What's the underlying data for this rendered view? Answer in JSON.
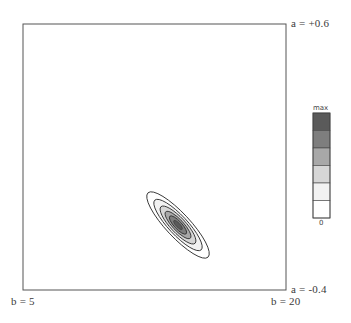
{
  "chart_data": {
    "type": "contour",
    "title": "",
    "x_axis": {
      "label_min": "b = 5",
      "label_max": "b = 20",
      "min": 5,
      "max": 20
    },
    "y_axis": {
      "label_min": "a = -0.4",
      "label_max": "a = +0.6",
      "min": -0.4,
      "max": 0.6
    },
    "grid": false,
    "peak": {
      "b": 13.5,
      "a": -0.15
    },
    "orientation_deg": 45,
    "contour_levels": [
      {
        "level": 1,
        "fill": "#ffffff",
        "rx": 44,
        "ry": 12
      },
      {
        "level": 2,
        "fill": "#f2f2f2",
        "rx": 34,
        "ry": 9.5
      },
      {
        "level": 3,
        "fill": "#d6d6d6",
        "rx": 25,
        "ry": 7.5
      },
      {
        "level": 4,
        "fill": "#a8a8a8",
        "rx": 18,
        "ry": 5.5
      },
      {
        "level": 5,
        "fill": "#7e7e7e",
        "rx": 12,
        "ry": 3.8
      },
      {
        "level": 6,
        "fill": "#5a5a5a",
        "rx": 6,
        "ry": 2
      }
    ],
    "legend": {
      "label_top": "max",
      "label_bottom": "0",
      "bands": [
        "#5a5a5a",
        "#7e7e7e",
        "#a8a8a8",
        "#d6d6d6",
        "#f2f2f2",
        "#ffffff"
      ],
      "position": "right"
    }
  },
  "labels": {
    "a_top": "a = +0.6",
    "a_bottom": "a = -0.4",
    "b_left": "b = 5",
    "b_right": "b = 20",
    "legend_max": "max",
    "legend_zero": "0"
  }
}
